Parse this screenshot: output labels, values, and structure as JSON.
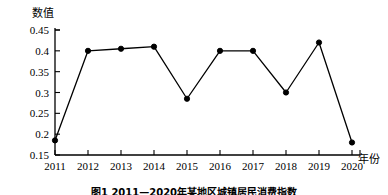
{
  "figure": {
    "caption": "图1 2011—2020年某地区城镇居民消费指数"
  },
  "axis_titles": {
    "y": "数值",
    "x": "年份"
  },
  "chart_data": {
    "type": "line",
    "title": "",
    "subtitle": "",
    "xlabel": "年份",
    "ylabel": "数值",
    "categories": [
      "2011",
      "2012",
      "2013",
      "2014",
      "2015",
      "2016",
      "2017",
      "2018",
      "2019",
      "2020"
    ],
    "values": [
      0.185,
      0.4,
      0.405,
      0.41,
      0.285,
      0.4,
      0.4,
      0.3,
      0.42,
      0.18
    ],
    "series": [
      {
        "name": "数值",
        "values": [
          0.185,
          0.4,
          0.405,
          0.41,
          0.285,
          0.4,
          0.4,
          0.3,
          0.42,
          0.18
        ]
      }
    ],
    "ylim": [
      0.15,
      0.45
    ],
    "yticks": [
      0.15,
      0.2,
      0.25,
      0.3,
      0.35,
      0.4,
      0.45
    ],
    "ytick_labels": [
      "0.15",
      "0.2",
      "0.25",
      "0.3",
      "0.35",
      "0.4",
      "0.45"
    ],
    "xtick_labels": [
      "2011",
      "2012",
      "2013",
      "2014",
      "2015",
      "2016",
      "2017",
      "2018",
      "2019",
      "2020"
    ],
    "grid": false,
    "legend": "none",
    "marker": "filled-circle",
    "line_color": "#000000",
    "marker_color": "#000000"
  }
}
